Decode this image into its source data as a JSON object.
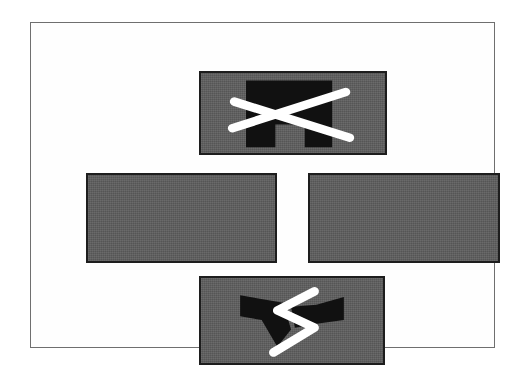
{
  "figure": {
    "title": "Abstract cross-shaped arrangement of four shaded panels",
    "background_color": "#ffffff",
    "frame": {
      "name": "outer-frame",
      "border_color": "#6f6f6f",
      "x": 30,
      "y": 22,
      "width": 465,
      "height": 326
    },
    "panel_fill_color": "#5e5e5e",
    "panel_outline_color": "#1d1d1d",
    "dark_shape_color": "#111111",
    "light_stroke_color": "#ffffff",
    "panels": [
      {
        "id": "top",
        "label": "Top panel",
        "x": 168,
        "y": 48,
        "width": 188,
        "height": 84,
        "contents": "black notched block overlaid by white X strokes",
        "dark_shape": "notched-block",
        "overlay": "x-cross"
      },
      {
        "id": "left",
        "label": "Left panel",
        "x": 55,
        "y": 150,
        "width": 191,
        "height": 90,
        "contents": "plain shaded rectangle",
        "dark_shape": "none",
        "overlay": "none"
      },
      {
        "id": "right",
        "label": "Right panel",
        "x": 277,
        "y": 150,
        "width": 192,
        "height": 90,
        "contents": "plain shaded rectangle",
        "dark_shape": "none",
        "overlay": "none"
      },
      {
        "id": "bottom",
        "label": "Bottom panel",
        "x": 168,
        "y": 253,
        "width": 186,
        "height": 89,
        "contents": "black double-chevron bowtie overlaid by white zigzag stroke",
        "dark_shape": "bowtie-chevrons",
        "overlay": "zigzag"
      }
    ]
  }
}
